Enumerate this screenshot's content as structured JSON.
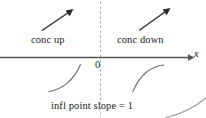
{
  "figure": {
    "background_color": "#ffffff",
    "ink_color": "#1a1a1a",
    "labels": {
      "conc_up": "conc up",
      "conc_down": "conc down",
      "origin": "0",
      "axis_x": "x",
      "caption": "infl point slope = 1"
    },
    "axis": {
      "name": "x-axis",
      "orientation": "horizontal",
      "y": 57,
      "x_start": 0,
      "x_end": 190,
      "arrowhead": "right",
      "color": "#555555"
    },
    "divider": {
      "name": "vertical-dashed-line-at-origin",
      "x": 100,
      "y_start": 0,
      "y_end": 118,
      "style": "dashed",
      "color": "#999999"
    },
    "arrows": [
      {
        "name": "slope-arrow-left",
        "region": "conc up",
        "direction": "up-right",
        "x1": 42,
        "y1": 30,
        "x2": 72,
        "y2": 10
      },
      {
        "name": "slope-arrow-right",
        "region": "conc down",
        "direction": "up-right",
        "x1": 139,
        "y1": 30,
        "x2": 170,
        "y2": 9
      }
    ],
    "curves": [
      {
        "name": "curve-concave-up",
        "concavity": "up",
        "path": "M 49 91 C 60 90 73 81 80 64"
      },
      {
        "name": "curve-concave-down",
        "concavity": "down",
        "path": "M 133 91 C 140 74 152 66 164 65"
      },
      {
        "name": "curve-fragment-corner",
        "concavity": "down",
        "path": "M 166 117 C 182 114 194 107 206 98"
      }
    ]
  }
}
